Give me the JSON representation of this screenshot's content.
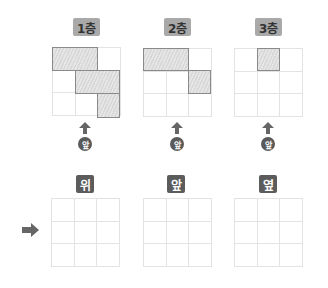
{
  "floors": [
    {
      "label": "1층",
      "shaded": [
        [
          0,
          0
        ],
        [
          0,
          1
        ],
        [
          1,
          1
        ],
        [
          1,
          2
        ],
        [
          2,
          2
        ]
      ]
    },
    {
      "label": "2층",
      "shaded": [
        [
          0,
          0
        ],
        [
          0,
          1
        ],
        [
          1,
          2
        ]
      ]
    },
    {
      "label": "3층",
      "shaded": [
        [
          0,
          1
        ]
      ]
    }
  ],
  "front_marker": "앞",
  "views": [
    {
      "label": "위"
    },
    {
      "label": "앞"
    },
    {
      "label": "옆"
    }
  ],
  "colors": {
    "floor_label_bg": "#a9a9a9",
    "view_label_bg": "#5c5c5c",
    "grid_line": "#e3e3e3",
    "shade_border": "#8a8a8a"
  }
}
